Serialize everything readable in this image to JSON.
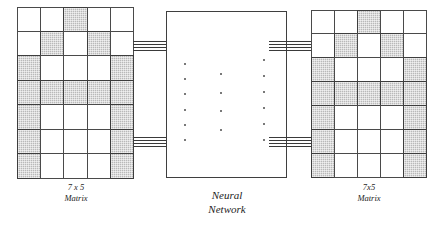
{
  "diagram": {
    "shade_color": "#b9b9b9",
    "line_color": "#3f3f3f"
  },
  "input_matrix": {
    "caption_line1": "7 x 5",
    "caption_line2": "Matrix",
    "rows": 7,
    "cols": 5,
    "grid": [
      [
        0,
        0,
        1,
        0,
        0
      ],
      [
        0,
        1,
        0,
        1,
        0
      ],
      [
        1,
        0,
        0,
        0,
        1
      ],
      [
        1,
        1,
        1,
        1,
        1
      ],
      [
        1,
        0,
        0,
        0,
        1
      ],
      [
        1,
        0,
        0,
        0,
        1
      ],
      [
        1,
        0,
        0,
        0,
        1
      ]
    ]
  },
  "output_matrix": {
    "caption_line1": "7x5",
    "caption_line2": "Matrix",
    "rows": 7,
    "cols": 5,
    "grid": [
      [
        0,
        0,
        1,
        0,
        0
      ],
      [
        0,
        1,
        0,
        1,
        0
      ],
      [
        1,
        0,
        0,
        0,
        1
      ],
      [
        1,
        1,
        1,
        1,
        1
      ],
      [
        1,
        0,
        0,
        0,
        1
      ],
      [
        1,
        0,
        0,
        0,
        1
      ],
      [
        1,
        0,
        0,
        0,
        1
      ]
    ]
  },
  "network": {
    "caption_line1": "Neural",
    "caption_line2": "Network",
    "dot_columns": [
      {
        "name": "input-layer-ellipsis",
        "count": 6
      },
      {
        "name": "hidden-layer-ellipsis",
        "count": 4
      },
      {
        "name": "output-layer-ellipsis",
        "count": 6
      }
    ]
  },
  "connections": {
    "wires_per_bundle": 4,
    "bundles": [
      {
        "name": "input-top-bundle"
      },
      {
        "name": "input-bottom-bundle"
      },
      {
        "name": "output-top-bundle"
      },
      {
        "name": "output-bottom-bundle"
      }
    ]
  }
}
